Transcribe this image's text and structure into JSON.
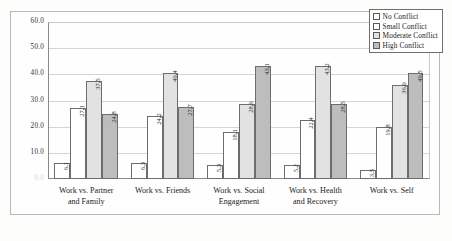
{
  "chart_data": {
    "type": "bar",
    "title": "",
    "subtitle": "",
    "xlabel": "",
    "ylabel": "",
    "ylim": [
      0.0,
      60.0
    ],
    "ytick_step": 10.0,
    "ytick_labels": [
      "60.0",
      "50.0",
      "40.0",
      "30.0",
      "20.0",
      "10.0",
      "0.0"
    ],
    "ytick_values": [
      60.0,
      50.0,
      40.0,
      30.0,
      20.0,
      10.0,
      0.0
    ],
    "grid": true,
    "grid_axis": "y",
    "legend_position": "top-right",
    "legend_border": true,
    "data_labels": true,
    "data_label_orientation": "vertical",
    "categories": [
      "Work vs. Partner and Family",
      "Work vs. Friends",
      "Work vs. Social Engagement",
      "Work vs. Health and Recovery",
      "Work vs. Self"
    ],
    "series": [
      {
        "name": "No Conflict",
        "fill": "#ffffff",
        "values": [
          6.1,
          6.3,
          5.3,
          5.2,
          3.5
        ],
        "labels": [
          "6,1",
          "6,3",
          "5,3",
          "5,2",
          "3,5"
        ]
      },
      {
        "name": "Small Conflict",
        "fill": "#ffffff",
        "values": [
          27.1,
          24.2,
          18.1,
          22.4,
          19.8
        ],
        "labels": [
          "27,1",
          "24,2",
          "18,1",
          "22,4",
          "19,8"
        ]
      },
      {
        "name": "Moderate Conflict",
        "fill": "#e2e2e2",
        "values": [
          37.5,
          40.4,
          28.6,
          43.2,
          36.0
        ],
        "labels": [
          "37,5",
          "40,4",
          "28,6",
          "43,2",
          "36,0"
        ]
      },
      {
        "name": "High Conflict",
        "fill": "#bdbdbd",
        "values": [
          24.8,
          27.7,
          43.1,
          28.5,
          40.5
        ],
        "labels": [
          "24,8",
          "27,7",
          "43,1",
          "28,5",
          "40,5"
        ]
      }
    ]
  },
  "category_lines": [
    [
      "Work vs. Partner",
      "and Family"
    ],
    [
      "Work vs. Friends"
    ],
    [
      "Work vs. Social",
      "Engagement"
    ],
    [
      "Work vs. Health",
      "and Recovery"
    ],
    [
      "Work vs. Self"
    ]
  ]
}
